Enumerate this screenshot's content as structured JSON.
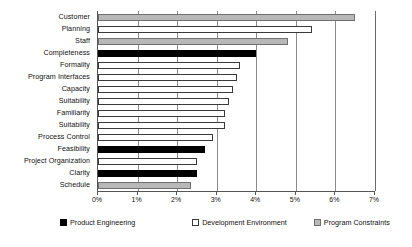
{
  "chart_data": {
    "type": "bar",
    "orientation": "horizontal",
    "title": "",
    "xlabel": "",
    "ylabel": "",
    "xlim": [
      0,
      7
    ],
    "xtick_labels": [
      "0%",
      "1%",
      "2%",
      "3%",
      "4%",
      "5%",
      "6%",
      "7%"
    ],
    "xtick_values": [
      0,
      1,
      2,
      3,
      4,
      5,
      6,
      7
    ],
    "grid": true,
    "legend_position": "bottom",
    "categories": [
      "Customer",
      "Planning",
      "Staff",
      "Completeness",
      "Formality",
      "Program Interfaces",
      "Capacity",
      "Suitability",
      "Familiarity",
      "Suitability",
      "Process Control",
      "Feasibility",
      "Project Organization",
      "Clarity",
      "Schedule"
    ],
    "values": [
      6.5,
      5.4,
      4.8,
      4.0,
      3.6,
      3.5,
      3.4,
      3.3,
      3.2,
      3.2,
      2.9,
      2.7,
      2.5,
      2.5,
      2.35
    ],
    "group_of_bar": [
      "Program Constraints",
      "Development Environment",
      "Program Constraints",
      "Product Engineering",
      "Development Environment",
      "Development Environment",
      "Development Environment",
      "Development Environment",
      "Development Environment",
      "Development Environment",
      "Development Environment",
      "Product Engineering",
      "Development Environment",
      "Product Engineering",
      "Program Constraints"
    ],
    "legend": [
      {
        "label": "Product Engineering",
        "color": "#000000",
        "key": "product-engineering"
      },
      {
        "label": "Development Environment",
        "color": "#ffffff",
        "key": "development-environment"
      },
      {
        "label": "Program Constraints",
        "color": "#b8b8b8",
        "key": "program-constraints"
      }
    ]
  }
}
